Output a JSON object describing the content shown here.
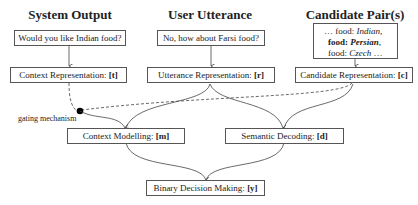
{
  "headers": {
    "system_output": "System Output",
    "user_utterance": "User Utterance",
    "candidate_pairs": "Candidate Pair(s)"
  },
  "inputs": {
    "system_utterance": "Would you like Indian food?",
    "user_utterance": "No, how about Farsi food?",
    "candidates": [
      {
        "prefix": "… food: ",
        "value": "Indian,",
        "bold": false
      },
      {
        "prefix": "food: ",
        "value": "Persian",
        "suffix": ",",
        "bold": true
      },
      {
        "prefix": "food: ",
        "value": "Czech",
        "suffix": " …",
        "bold": false
      }
    ]
  },
  "nodes": {
    "context_rep": {
      "label": "Context Representation: ",
      "var": "[t]"
    },
    "utterance_rep": {
      "label": "Utterance Representation: ",
      "var": "[r]"
    },
    "candidate_rep": {
      "label": "Candidate Representation: ",
      "var": "[c]"
    },
    "context_modelling": {
      "label": "Context Modelling: ",
      "var": "[m]"
    },
    "semantic_decoding": {
      "label": "Semantic Decoding: ",
      "var": "[d]"
    },
    "binary_decision": {
      "label": "Binary Decision Making: ",
      "var": "[y]"
    }
  },
  "annotations": {
    "gating": "gating mechanism"
  },
  "colors": {
    "line": "#444444",
    "box_border": "#555555"
  }
}
